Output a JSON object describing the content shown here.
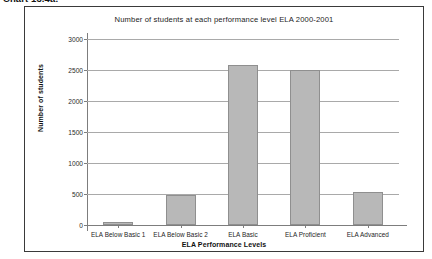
{
  "caption": "Chart 13.4a:",
  "chart_data": {
    "type": "bar",
    "title": "Number of students at each performance level ELA 2000-2001",
    "xlabel": "ELA Performance Levels",
    "ylabel": "Number of students",
    "categories": [
      "ELA Below Basic 1",
      "ELA Below Basic 2",
      "ELA Basic",
      "ELA Proficient",
      "ELA Advanced"
    ],
    "values": [
      50,
      480,
      2580,
      2500,
      530
    ],
    "ylim": [
      0,
      3000
    ],
    "yticks": [
      0,
      500,
      1000,
      1500,
      2000,
      2500,
      3000
    ],
    "ytick_labels": [
      "0",
      "500",
      "1000",
      "1500",
      "2000",
      "2500",
      "3000"
    ],
    "grid": true,
    "legend": false,
    "bar_color": "#b8b8b8",
    "bar_border_color": "#8f8f8f",
    "axis_color": "#7d7d7d",
    "gridline_color": "#a9a9a9",
    "frame_color": "#3a3a3a",
    "background": "#ffffff"
  }
}
